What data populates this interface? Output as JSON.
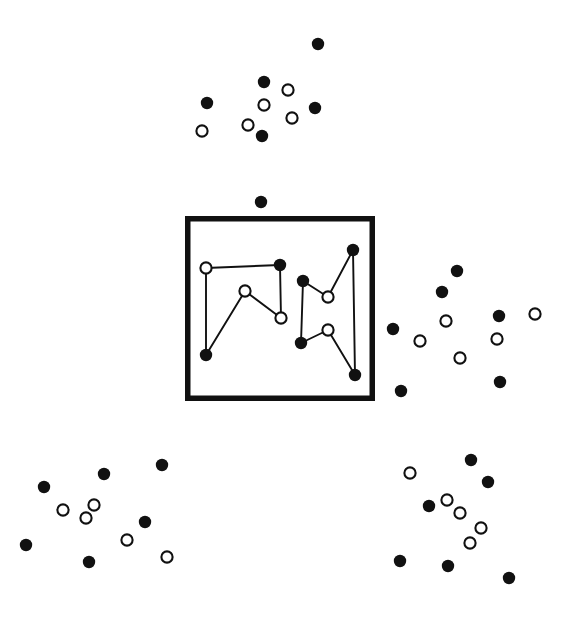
{
  "figure": {
    "title": "",
    "canvas": {
      "width": 573,
      "height": 620,
      "background": "#ffffff"
    },
    "style": {
      "filled_marker_color": "#111111",
      "open_marker_fill": "#ffffff",
      "open_marker_stroke": "#111111",
      "filled_marker_radius": 6.2,
      "open_marker_radius": 5.6,
      "open_marker_stroke_width": 2.1,
      "link_color": "#111111",
      "link_width": 1.9,
      "frame_color": "#111111",
      "frame_stroke_width": 5.5
    },
    "frame": {
      "label": "highlighted-region-frame",
      "x": 185,
      "y": 216,
      "width": 190,
      "height": 185
    },
    "groups": [
      {
        "name": "top-cluster",
        "points": [
          {
            "x": 318,
            "y": 44,
            "type": "filled"
          },
          {
            "x": 264,
            "y": 82,
            "type": "filled"
          },
          {
            "x": 207,
            "y": 103,
            "type": "filled"
          },
          {
            "x": 288,
            "y": 90,
            "type": "open"
          },
          {
            "x": 264,
            "y": 105,
            "type": "open"
          },
          {
            "x": 315,
            "y": 108,
            "type": "filled"
          },
          {
            "x": 248,
            "y": 125,
            "type": "open"
          },
          {
            "x": 292,
            "y": 118,
            "type": "open"
          },
          {
            "x": 202,
            "y": 131,
            "type": "open"
          },
          {
            "x": 262,
            "y": 136,
            "type": "filled"
          }
        ]
      },
      {
        "name": "isolated-point-above-frame",
        "points": [
          {
            "x": 261,
            "y": 202,
            "type": "filled"
          }
        ]
      },
      {
        "name": "framed-chain-left",
        "points": [
          {
            "x": 206,
            "y": 268,
            "type": "open"
          },
          {
            "x": 280,
            "y": 265,
            "type": "filled"
          },
          {
            "x": 245,
            "y": 291,
            "type": "open"
          },
          {
            "x": 281,
            "y": 318,
            "type": "open"
          },
          {
            "x": 206,
            "y": 355,
            "type": "filled"
          }
        ],
        "links": [
          {
            "from": 0,
            "to": 1
          },
          {
            "from": 1,
            "to": 3
          },
          {
            "from": 3,
            "to": 2
          },
          {
            "from": 2,
            "to": 4
          },
          {
            "from": 4,
            "to": 0
          }
        ]
      },
      {
        "name": "framed-chain-right",
        "points": [
          {
            "x": 353,
            "y": 250,
            "type": "filled"
          },
          {
            "x": 303,
            "y": 281,
            "type": "filled"
          },
          {
            "x": 328,
            "y": 297,
            "type": "open"
          },
          {
            "x": 328,
            "y": 330,
            "type": "open"
          },
          {
            "x": 301,
            "y": 343,
            "type": "filled"
          },
          {
            "x": 355,
            "y": 375,
            "type": "filled"
          }
        ],
        "links": [
          {
            "from": 1,
            "to": 2
          },
          {
            "from": 2,
            "to": 0
          },
          {
            "from": 0,
            "to": 5
          },
          {
            "from": 1,
            "to": 4
          },
          {
            "from": 4,
            "to": 3
          },
          {
            "from": 3,
            "to": 5
          }
        ]
      },
      {
        "name": "right-cluster",
        "points": [
          {
            "x": 457,
            "y": 271,
            "type": "filled"
          },
          {
            "x": 442,
            "y": 292,
            "type": "filled"
          },
          {
            "x": 446,
            "y": 321,
            "type": "open"
          },
          {
            "x": 499,
            "y": 316,
            "type": "filled"
          },
          {
            "x": 535,
            "y": 314,
            "type": "open"
          },
          {
            "x": 393,
            "y": 329,
            "type": "filled"
          },
          {
            "x": 420,
            "y": 341,
            "type": "open"
          },
          {
            "x": 497,
            "y": 339,
            "type": "open"
          },
          {
            "x": 460,
            "y": 358,
            "type": "open"
          },
          {
            "x": 500,
            "y": 382,
            "type": "filled"
          },
          {
            "x": 401,
            "y": 391,
            "type": "filled"
          }
        ]
      },
      {
        "name": "bottom-left-cluster",
        "points": [
          {
            "x": 162,
            "y": 465,
            "type": "filled"
          },
          {
            "x": 104,
            "y": 474,
            "type": "filled"
          },
          {
            "x": 44,
            "y": 487,
            "type": "filled"
          },
          {
            "x": 94,
            "y": 505,
            "type": "open"
          },
          {
            "x": 63,
            "y": 510,
            "type": "open"
          },
          {
            "x": 86,
            "y": 518,
            "type": "open"
          },
          {
            "x": 145,
            "y": 522,
            "type": "filled"
          },
          {
            "x": 127,
            "y": 540,
            "type": "open"
          },
          {
            "x": 26,
            "y": 545,
            "type": "filled"
          },
          {
            "x": 89,
            "y": 562,
            "type": "filled"
          },
          {
            "x": 167,
            "y": 557,
            "type": "open"
          }
        ]
      },
      {
        "name": "bottom-right-cluster",
        "points": [
          {
            "x": 471,
            "y": 460,
            "type": "filled"
          },
          {
            "x": 410,
            "y": 473,
            "type": "open"
          },
          {
            "x": 488,
            "y": 482,
            "type": "filled"
          },
          {
            "x": 447,
            "y": 500,
            "type": "open"
          },
          {
            "x": 429,
            "y": 506,
            "type": "filled"
          },
          {
            "x": 460,
            "y": 513,
            "type": "open"
          },
          {
            "x": 481,
            "y": 528,
            "type": "open"
          },
          {
            "x": 470,
            "y": 543,
            "type": "open"
          },
          {
            "x": 400,
            "y": 561,
            "type": "filled"
          },
          {
            "x": 448,
            "y": 566,
            "type": "filled"
          },
          {
            "x": 509,
            "y": 578,
            "type": "filled"
          }
        ]
      }
    ]
  }
}
